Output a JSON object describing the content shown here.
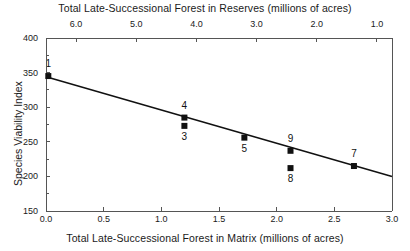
{
  "chart_data": {
    "type": "scatter",
    "title": "",
    "xlabel": "Total Late-Successional Forest in Matrix (millions of acres)",
    "ylabel": "Species Viability Index",
    "x2label": "Total Late-Successional Forest in Reserves (millions of acres)",
    "xlim": [
      0.0,
      3.0
    ],
    "ylim": [
      150,
      400
    ],
    "x2lim": [
      6.5,
      0.75
    ],
    "grid": false,
    "legend": null,
    "xticks": [
      "0.0",
      "0.5",
      "1.0",
      "1.5",
      "2.0",
      "2.5",
      "3.0"
    ],
    "xtick_values": [
      0.0,
      0.5,
      1.0,
      1.5,
      2.0,
      2.5,
      3.0
    ],
    "yticks": [
      "150",
      "200",
      "250",
      "300",
      "350",
      "400"
    ],
    "ytick_values": [
      150,
      200,
      250,
      300,
      350,
      400
    ],
    "x2ticks": [
      "6.0",
      "5.0",
      "4.0",
      "3.0",
      "2.0",
      "1.0"
    ],
    "x2tick_values": [
      6.0,
      5.0,
      4.0,
      3.0,
      2.0,
      1.0
    ],
    "points": [
      {
        "label": "1",
        "x": 0.02,
        "y": 345,
        "label_pos": "above"
      },
      {
        "label": "4",
        "x": 1.2,
        "y": 285,
        "label_pos": "above"
      },
      {
        "label": "3",
        "x": 1.2,
        "y": 273,
        "label_pos": "below"
      },
      {
        "label": "5",
        "x": 1.72,
        "y": 256,
        "label_pos": "below"
      },
      {
        "label": "9",
        "x": 2.12,
        "y": 237,
        "label_pos": "above"
      },
      {
        "label": "8",
        "x": 2.12,
        "y": 212,
        "label_pos": "below"
      },
      {
        "label": "7",
        "x": 2.67,
        "y": 215,
        "label_pos": "above"
      }
    ],
    "trendline": {
      "x0": 0.0,
      "y0": 344,
      "x1": 3.0,
      "y1": 200
    },
    "marker_color": "#111111",
    "line_color": "#111111",
    "axis_color": "#555555"
  }
}
